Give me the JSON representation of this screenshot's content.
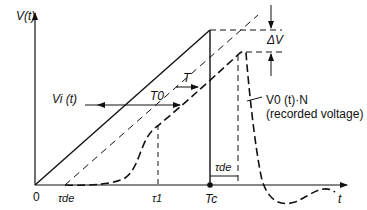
{
  "axes": {
    "y_label": "V(t)",
    "x_label": "t",
    "origin_label": "0"
  },
  "x_ticks": {
    "tau_de": "τde",
    "tau_1": "τ1",
    "T_c": "Tc"
  },
  "annotations": {
    "input_voltage": "Vi (t)",
    "T0": "T0",
    "T": "T",
    "delta_V": "ΔV",
    "recorded_voltage_name": "V0 (t)·N",
    "recorded_voltage_desc": "(recorded voltage)",
    "tau_de_interval": "τde"
  },
  "curves": [
    {
      "name": "input voltage Vi(t)",
      "style": "solid",
      "shape": "linear ramp from 0 to Tc, then drops to 0 at Tc"
    },
    {
      "name": "delayed ideal ramp",
      "style": "dashed",
      "shape": "linear ramp starting at τde, parallel to Vi(t)"
    },
    {
      "name": "recorded voltage V0(t)·N",
      "style": "dashed-bold",
      "shape": "slow rise from τde, approaches ramp, peaks ΔV below delayed ramp, falls after Tc+τde with damped oscillation"
    }
  ]
}
